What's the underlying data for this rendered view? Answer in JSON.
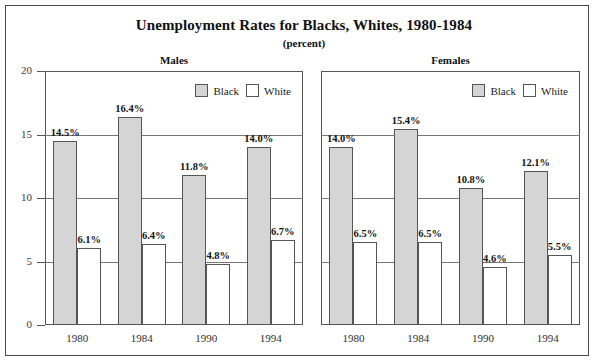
{
  "chart_data": {
    "type": "bar",
    "title": "Unemployment Rates for Blacks, Whites, 1980-1984",
    "subtitle": "(percent)",
    "xlabel": "",
    "ylabel": "",
    "ylim": [
      0,
      20
    ],
    "yticks": [
      0,
      5,
      10,
      15,
      20
    ],
    "ytick_labels": [
      "0",
      "5",
      "10",
      "15",
      "20"
    ],
    "grid": true,
    "legend": [
      "Black",
      "White"
    ],
    "legend_position": "top-right",
    "categories": [
      "1980",
      "1984",
      "1990",
      "1994"
    ],
    "panels": [
      {
        "name": "Males",
        "series": [
          {
            "name": "Black",
            "values": [
              14.5,
              16.4,
              11.8,
              14.0
            ],
            "labels": [
              "14.5%",
              "16.4%",
              "11.8%",
              "14.0%"
            ],
            "color": "#d5d5d5"
          },
          {
            "name": "White",
            "values": [
              6.1,
              6.4,
              4.8,
              6.7
            ],
            "labels": [
              "6.1%",
              "6.4%",
              "4.8%",
              "6.7%"
            ],
            "color": "#ffffff"
          }
        ]
      },
      {
        "name": "Females",
        "series": [
          {
            "name": "Black",
            "values": [
              14.0,
              15.4,
              10.8,
              12.1
            ],
            "labels": [
              "14.0%",
              "15.4%",
              "10.8%",
              "12.1%"
            ],
            "color": "#d5d5d5"
          },
          {
            "name": "White",
            "values": [
              6.5,
              6.5,
              4.6,
              5.5
            ],
            "labels": [
              "6.5%",
              "6.5%",
              "4.6%",
              "5.5%"
            ],
            "color": "#ffffff"
          }
        ]
      }
    ]
  },
  "colors": {
    "black_series": "#d5d5d5",
    "white_series": "#ffffff",
    "outline": "#555555",
    "gridline": "#777777",
    "frame": "#4a4a4a"
  }
}
